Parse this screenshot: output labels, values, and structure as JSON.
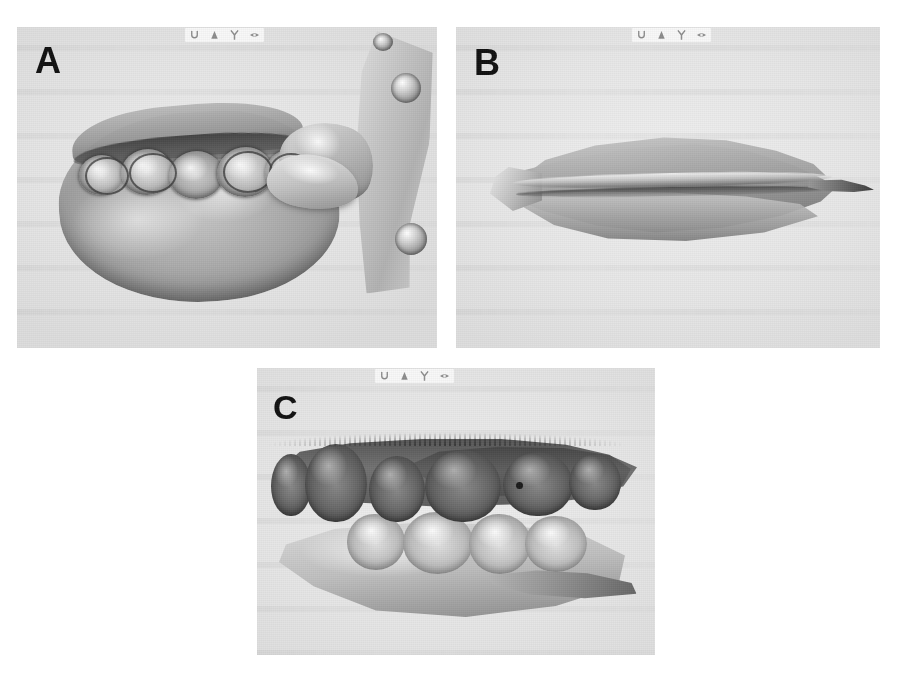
{
  "figure": {
    "caption_labels": [
      "A",
      "B",
      "C"
    ],
    "background_color": "#ffffff",
    "panel_background_color": "#e7e6e3",
    "label_color": "#111111",
    "panels": [
      {
        "id": "A",
        "label": "A",
        "description": "Occlusal view of a grayscale 3D-scanned maxillary dental cast with a perforated plate artifact at the right edge",
        "toolbar": {
          "icons": [
            "undo-icon",
            "cone-icon",
            "tuning-fork-icon",
            "eye-icon"
          ],
          "icon_order": "normal"
        }
      },
      {
        "id": "B",
        "label": "B",
        "description": "Lateral view of the grayscale 3D-scanned cast showing the occlusal seam between upper and lower arches",
        "toolbar": {
          "icons": [
            "eye-icon",
            "tuning-fork-icon",
            "cone-icon",
            "undo-icon"
          ],
          "icon_order": "reversed"
        }
      },
      {
        "id": "C",
        "label": "C",
        "description": "Buccal view of the grayscale 3D-scanned casts in occlusion, dark upper teeth above light lower teeth",
        "toolbar": {
          "icons": [
            "undo-icon",
            "cone-icon",
            "tuning-fork-icon",
            "eye-icon"
          ],
          "icon_order": "normal"
        }
      }
    ]
  },
  "panel_a_geometry": {
    "teeth": [
      {
        "left": 62,
        "top": 128,
        "width": 44,
        "height": 40
      },
      {
        "left": 104,
        "top": 122,
        "width": 52,
        "height": 46
      },
      {
        "left": 152,
        "top": 124,
        "width": 54,
        "height": 48
      },
      {
        "left": 200,
        "top": 120,
        "width": 56,
        "height": 50
      },
      {
        "left": 248,
        "top": 122,
        "width": 50,
        "height": 46
      }
    ],
    "sockets": [
      {
        "left": 68,
        "top": 130,
        "width": 40,
        "height": 34
      },
      {
        "left": 112,
        "top": 126,
        "width": 44,
        "height": 36
      },
      {
        "left": 206,
        "top": 124,
        "width": 46,
        "height": 38
      },
      {
        "left": 252,
        "top": 126,
        "width": 40,
        "height": 34
      }
    ],
    "holes": [
      {
        "left": 374,
        "top": 46,
        "width": 30,
        "height": 30
      },
      {
        "left": 378,
        "top": 196,
        "width": 32,
        "height": 32
      },
      {
        "left": 356,
        "top": 6,
        "width": 20,
        "height": 18
      }
    ]
  },
  "panel_c_geometry": {
    "upper_teeth": [
      {
        "left": 14,
        "top": 86,
        "width": 40,
        "height": 62
      },
      {
        "left": 48,
        "top": 76,
        "width": 62,
        "height": 78
      },
      {
        "left": 112,
        "top": 88,
        "width": 56,
        "height": 66
      },
      {
        "left": 168,
        "top": 82,
        "width": 76,
        "height": 72
      },
      {
        "left": 246,
        "top": 84,
        "width": 70,
        "height": 64
      },
      {
        "left": 312,
        "top": 86,
        "width": 52,
        "height": 56
      }
    ],
    "lower_teeth": [
      {
        "left": 90,
        "top": 146,
        "width": 58,
        "height": 56
      },
      {
        "left": 146,
        "top": 144,
        "width": 70,
        "height": 62
      },
      {
        "left": 212,
        "top": 146,
        "width": 62,
        "height": 60
      },
      {
        "left": 268,
        "top": 148,
        "width": 62,
        "height": 56
      }
    ]
  }
}
